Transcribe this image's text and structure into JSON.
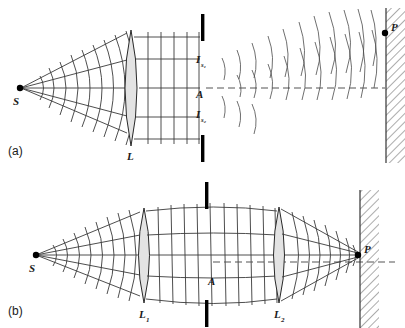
{
  "figure": {
    "type": "optics-ray-diagram",
    "panels": [
      {
        "id": "a",
        "panel_label": "(a)",
        "labels": {
          "source": "S",
          "lens": "L",
          "image_upper": "I",
          "image_upper_sub": "s₁",
          "axis_point": "A",
          "image_lower": "I",
          "image_lower_sub": "s₂",
          "focus_point": "P"
        }
      },
      {
        "id": "b",
        "panel_label": "(b)",
        "labels": {
          "source": "S",
          "lens_first": "L",
          "lens_first_sub": "1",
          "lens_second": "L",
          "lens_second_sub": "2",
          "axis_point": "A",
          "focus_point": "P"
        }
      }
    ],
    "colors": {
      "ink": "#1a1a1a",
      "ray": "#3a3a3a",
      "lens_glass": "#e3e3e3",
      "stop": "#000000",
      "axis_dash": "#555555",
      "background": "#ffffff"
    }
  }
}
